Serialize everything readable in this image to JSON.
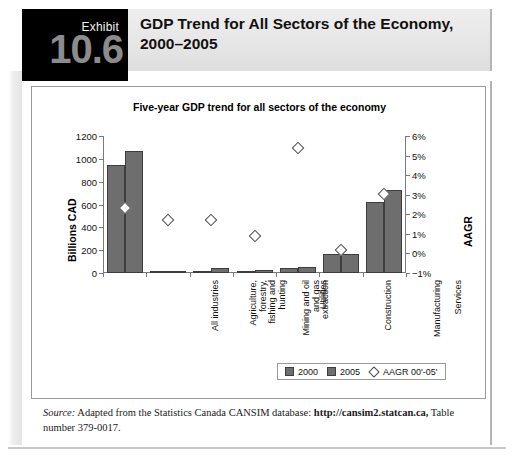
{
  "exhibit": {
    "label": "Exhibit",
    "number": "10.6",
    "title": "GDP Trend for All Sectors of the Economy, 2000–2005"
  },
  "source": {
    "label": "Source:",
    "text_before": " Adapted from the Statistics Canada CANSIM database: ",
    "url": "http://cansim2.statcan.ca,",
    "text_after": " Table number 379-0017."
  },
  "legend": {
    "items": [
      {
        "name": "2000",
        "marker": "square"
      },
      {
        "name": "2005",
        "marker": "square"
      },
      {
        "name": "AAGR 00'-05'",
        "marker": "diamond"
      }
    ]
  },
  "colors": {
    "bar": "#6e6e6e",
    "bar_edge": "#3d3d3d",
    "marker_fill": "#ffffff",
    "marker_edge": "#4a4a4a",
    "axis": "#7a7a7a",
    "header_band": "#e6e6e6",
    "exhibit_block": "#000000",
    "exhibit_number": "#8c8c8c"
  },
  "chart_data": {
    "type": "bar",
    "title": "Five-year GDP trend for all sectors of the economy",
    "xlabel": "",
    "ylabel": "Billions CAD",
    "y2label": "AAGR",
    "ylim": [
      0,
      1200
    ],
    "yticks": [
      0,
      200,
      400,
      600,
      800,
      1000,
      1200
    ],
    "ytick_labels": [
      "0",
      "200",
      "400",
      "600",
      "800",
      "1000",
      "1200"
    ],
    "y2lim": [
      -1,
      6
    ],
    "y2ticks": [
      -1,
      0,
      1,
      2,
      3,
      4,
      5,
      6
    ],
    "y2tick_labels": [
      "−1%",
      "0%",
      "1%",
      "2%",
      "3%",
      "4%",
      "5%",
      "6%"
    ],
    "grid": false,
    "legend_position": "bottom-right",
    "categories": [
      "All industries",
      "Agriculture, forestry, fishing and hunting",
      "Mining and oil and gas extraction",
      "Utilities",
      "Construction",
      "Manufacturing",
      "Services"
    ],
    "category_label_lines": [
      [
        "All industries"
      ],
      [
        "Agriculture,",
        "forestry,",
        "fishing and",
        "hunting"
      ],
      [
        "Mining and oil",
        "and gas",
        "extraction"
      ],
      [
        "Utilities"
      ],
      [
        "Construction"
      ],
      [
        "Manufacturing"
      ],
      [
        "Services"
      ]
    ],
    "series": [
      {
        "name": "2000",
        "axis": "left",
        "unit": "Billions CAD",
        "values": [
          950,
          18,
          20,
          20,
          40,
          168,
          625
        ]
      },
      {
        "name": "2005",
        "axis": "left",
        "unit": "Billions CAD",
        "values": [
          1065,
          20,
          40,
          28,
          55,
          170,
          730
        ]
      },
      {
        "name": "AAGR 00'-05'",
        "axis": "right",
        "unit": "%",
        "type": "scatter",
        "values": [
          2.3,
          1.7,
          1.7,
          0.9,
          5.4,
          0.2,
          3.05
        ]
      }
    ]
  }
}
